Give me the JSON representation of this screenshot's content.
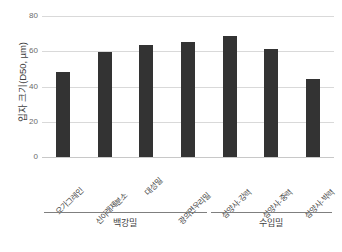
{
  "chart_data": {
    "type": "bar",
    "title": "",
    "subtitle": "",
    "xlabel": "",
    "ylabel": "입자 크기(D50, µm)",
    "ylim": [
      0,
      80
    ],
    "yticks": [
      0,
      20,
      40,
      60,
      80
    ],
    "ytick_labels": [
      "0",
      "20",
      "40",
      "60",
      "80"
    ],
    "grid": "horizontal",
    "legend": "none",
    "bar_color": "#333333",
    "categories": [
      "오가그레인",
      "신아래제분소",
      "대성밀",
      "광의면우리밀",
      "삼양사-강력",
      "삼양사-중력",
      "삼양사-박력"
    ],
    "values": [
      48.5,
      59.8,
      63.5,
      65.3,
      68.8,
      61.2,
      44.5
    ],
    "groups": [
      {
        "label": "백강밀",
        "start_index": 0,
        "end_index": 3
      },
      {
        "label": "수입밀",
        "start_index": 4,
        "end_index": 6
      }
    ],
    "annotations": []
  }
}
